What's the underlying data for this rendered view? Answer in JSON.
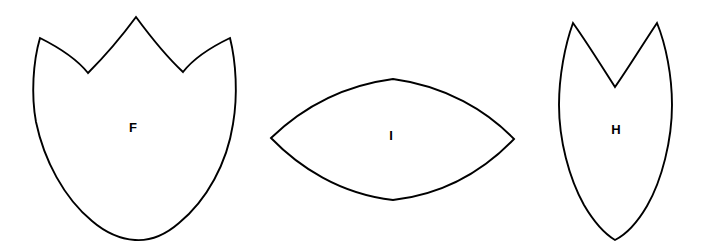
{
  "figure": {
    "background_color": "#ffffff",
    "stroke_color": "#000000",
    "fill_color": "#ffffff",
    "width": 715,
    "height": 251,
    "label_color": "#000000"
  },
  "shapes": [
    {
      "id": "shape-f",
      "label": "F",
      "name": "tulip-petal-shape",
      "description": "Three-pointed tulip or petal outline with rounded lower body",
      "label_x": 133,
      "label_y": 129,
      "bbox": {
        "x": 31,
        "y": 16,
        "width": 207,
        "height": 225
      },
      "path": "M 136 17 C 150 36 168 58 183 72 C 190 63 205 50 230 38 C 236 62 238 95 233 124 C 227 163 207 200 179 223 C 164 236 149 241 135 240 C 121 239 106 233 92 221 C 64 198 44 160 36 122 C 31 95 33 62 40 38 C 64 50 80 63 88 73 C 103 58 122 36 136 17 Z"
    },
    {
      "id": "shape-i",
      "label": "I",
      "name": "lens-vesica-shape",
      "description": "Pointed oval lens or vesica outline with two lateral points",
      "label_x": 391,
      "label_y": 137,
      "bbox": {
        "x": 270,
        "y": 78,
        "width": 245,
        "height": 123
      },
      "path": "M 271 138 C 300 110 340 86 393 79 C 446 86 487 111 514 139 C 486 168 446 194 393 200 C 340 194 299 167 271 138 Z"
    },
    {
      "id": "shape-h",
      "label": "H",
      "name": "heart-shield-shape",
      "description": "Two-lobed heart or shield outline with a V notch on top and a pointed base",
      "label_x": 616,
      "label_y": 131,
      "bbox": {
        "x": 558,
        "y": 22,
        "width": 115,
        "height": 219
      },
      "path": "M 573 23 C 588 44 604 70 615 87 C 627 70 643 44 657 23 C 666 45 672 76 672 105 C 672 140 662 180 647 206 C 637 223 625 235 615 240 C 605 234 594 222 584 205 C 569 178 559 140 559 105 C 559 76 565 45 573 23 Z"
    }
  ]
}
